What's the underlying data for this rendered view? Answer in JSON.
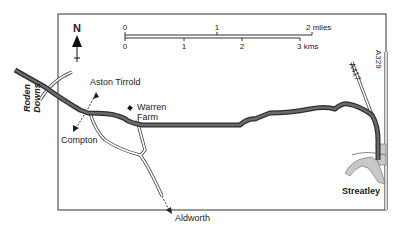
{
  "map": {
    "north_label": "N",
    "scale": {
      "miles": {
        "ticks": [
          "0",
          "1",
          "2 miles"
        ]
      },
      "kms": {
        "ticks": [
          "0",
          "1",
          "2",
          "3 kms"
        ]
      }
    },
    "places": {
      "roden_downs_1": "Roden",
      "roden_downs_2": "Downs",
      "aston_tirrold": "Aston Tirrold",
      "warren_farm_1": "Warren",
      "warren_farm_2": "Farm",
      "compton": "Compton",
      "aldworth": "Aldworth",
      "streatley": "Streatley"
    },
    "roads": {
      "a417": "A417",
      "a329": "A329"
    },
    "colors": {
      "route": "#5a5a5a",
      "route_outline": "#2e2e2e",
      "town": "#c8c8c8",
      "frame": "#333333"
    }
  }
}
